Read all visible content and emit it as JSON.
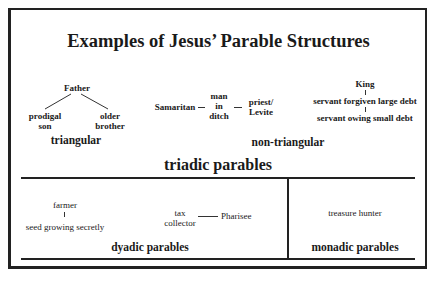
{
  "title": "Examples of Jesus’ Parable Structures",
  "triadic": {
    "label": "triadic parables",
    "triangular": {
      "label": "triangular",
      "top": "Father",
      "left_line1": "prodigal",
      "left_line2": "son",
      "right_line1": "older",
      "right_line2": "brother"
    },
    "non_triangular": {
      "label": "non-triangular",
      "linear": {
        "left": "Samaritan",
        "middle_line1": "man",
        "middle_line2": "in",
        "middle_line3": "ditch",
        "right_line1": "priest/",
        "right_line2": "Levite"
      },
      "vertical": {
        "top": "King",
        "middle": "servant forgiven large debt",
        "bottom": "servant owing small debt"
      }
    }
  },
  "dyadic": {
    "label": "dyadic parables",
    "vertical": {
      "top": "farmer",
      "bottom": "seed growing secretly"
    },
    "horizontal": {
      "left_line1": "tax",
      "left_line2": "collector",
      "right": "Pharisee"
    }
  },
  "monadic": {
    "label": "monadic parables",
    "item": "treasure hunter"
  }
}
